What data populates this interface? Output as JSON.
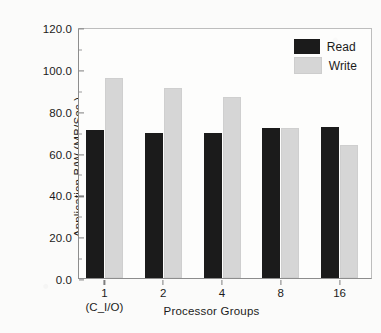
{
  "chart_data": {
    "type": "bar",
    "title": "",
    "xlabel": "Processor Groups",
    "ylabel": "Application B/W (MB/Sec.)",
    "categories": [
      "1",
      "2",
      "4",
      "8",
      "16"
    ],
    "category_sublabels": [
      "(C_I/O)",
      "",
      "",
      "",
      ""
    ],
    "series": [
      {
        "name": "Read",
        "color": "#1b1b1b",
        "values": [
          70.8,
          69.2,
          69.2,
          71.8,
          72.2
        ]
      },
      {
        "name": "Write",
        "color": "#d6d6d6",
        "values": [
          95.7,
          90.9,
          86.4,
          71.5,
          63.8
        ]
      }
    ],
    "ylim": [
      0,
      120
    ],
    "ytick_labels": [
      "0.0",
      "20.0",
      "40.0",
      "60.0",
      "80.0",
      "100.0",
      "120.0"
    ],
    "ytick_values": [
      0,
      20,
      40,
      60,
      80,
      100,
      120
    ],
    "yminor_values": [
      10,
      30,
      50,
      70,
      90,
      110
    ],
    "grid": false,
    "legend_position": "top-right"
  },
  "legend": {
    "entries": [
      {
        "label": "Read"
      },
      {
        "label": "Write"
      }
    ]
  }
}
